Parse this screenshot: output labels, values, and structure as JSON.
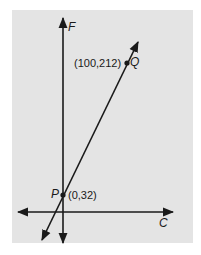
{
  "diagram": {
    "type": "coordinate-graph",
    "axes": {
      "vertical": {
        "label": "F"
      },
      "horizontal": {
        "label": "C"
      }
    },
    "points": [
      {
        "name": "P",
        "coords": "(0,32)"
      },
      {
        "name": "Q",
        "coords": "(100,212)"
      }
    ],
    "line": {
      "through": [
        "P",
        "Q"
      ]
    },
    "colors": {
      "panel": "#e4e4e4",
      "ink": "#1a1a1a",
      "background": "#ffffff"
    }
  }
}
